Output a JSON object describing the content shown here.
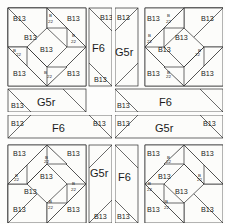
{
  "diagram": {
    "patch_labels": {
      "b13": "B13",
      "b22_line1": "B",
      "b22_line2": "22",
      "f6": "F6",
      "g5r": "G5r"
    },
    "colors": {
      "ink": "#2b2b2b",
      "patch_fill": "#fcfcfa",
      "background": "#fdfdfc"
    },
    "quadrants": [
      {
        "name": "top-left",
        "star_position": "top-left",
        "strip_vertical": "F6",
        "strip_vertical_position": "right",
        "strip_horizontal": "G5r",
        "strip_horizontal_position": "bottom",
        "corner_patches": [
          "B13",
          "B13",
          "B13",
          "B13"
        ],
        "small_patches": [
          "B22",
          "B22",
          "B22",
          "B22"
        ],
        "center_patches": [
          "B13",
          "B13"
        ]
      },
      {
        "name": "top-right",
        "star_position": "top-right",
        "strip_vertical": "G5r",
        "strip_vertical_position": "left",
        "strip_horizontal": "F6",
        "strip_horizontal_position": "bottom",
        "corner_patches": [
          "B13",
          "B13",
          "B13",
          "B13"
        ],
        "small_patches": [
          "B22",
          "B22",
          "B22",
          "B22"
        ],
        "center_patches": [
          "B13",
          "B13"
        ]
      },
      {
        "name": "bottom-left",
        "star_position": "bottom-left",
        "strip_vertical": "G5r",
        "strip_vertical_position": "right",
        "strip_horizontal": "F6",
        "strip_horizontal_position": "top",
        "corner_patches": [
          "B13",
          "B13",
          "B13",
          "B13"
        ],
        "small_patches": [
          "B22",
          "B22",
          "B22",
          "B22"
        ],
        "center_patches": [
          "B13",
          "B13"
        ]
      },
      {
        "name": "bottom-right",
        "star_position": "bottom-right",
        "strip_vertical": "F6",
        "strip_vertical_position": "left",
        "strip_horizontal": "G5r",
        "strip_horizontal_position": "top",
        "corner_patches": [
          "B13",
          "B13",
          "B13",
          "B13"
        ],
        "small_patches": [
          "B22",
          "B22",
          "B22",
          "B22"
        ],
        "center_patches": [
          "B13",
          "B13"
        ]
      }
    ]
  }
}
